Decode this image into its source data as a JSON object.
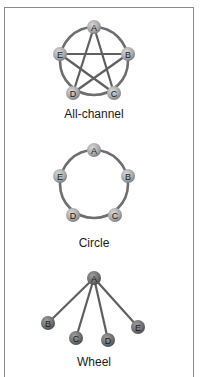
{
  "diagrams": [
    {
      "title": "All-channel",
      "type": "all-channel",
      "nodes": [
        {
          "id": "A",
          "x": 94,
          "y": 27
        },
        {
          "id": "B",
          "x": 128,
          "y": 54
        },
        {
          "id": "C",
          "x": 114,
          "y": 93
        },
        {
          "id": "D",
          "x": 73,
          "y": 93
        },
        {
          "id": "E",
          "x": 60,
          "y": 54
        }
      ],
      "ring": {
        "cx": 94,
        "cy": 61,
        "r": 34
      },
      "edges": [
        [
          "A",
          "C"
        ],
        [
          "A",
          "D"
        ],
        [
          "B",
          "D"
        ],
        [
          "B",
          "E"
        ],
        [
          "C",
          "E"
        ]
      ],
      "label_y": 118
    },
    {
      "title": "Circle",
      "type": "circle",
      "nodes": [
        {
          "id": "A",
          "x": 94,
          "y": 150
        },
        {
          "id": "B",
          "x": 128,
          "y": 176
        },
        {
          "id": "C",
          "x": 115,
          "y": 215
        },
        {
          "id": "D",
          "x": 73,
          "y": 215
        },
        {
          "id": "E",
          "x": 60,
          "y": 176
        }
      ],
      "ring": {
        "cx": 94,
        "cy": 184,
        "r": 34
      },
      "edges": [],
      "label_y": 247
    },
    {
      "title": "Wheel",
      "type": "wheel",
      "nodes": [
        {
          "id": "A",
          "x": 94,
          "y": 278
        },
        {
          "id": "B",
          "x": 48,
          "y": 323
        },
        {
          "id": "C",
          "x": 76,
          "y": 338
        },
        {
          "id": "D",
          "x": 108,
          "y": 340
        },
        {
          "id": "E",
          "x": 138,
          "y": 327
        }
      ],
      "ring": null,
      "edges": [
        [
          "A",
          "B"
        ],
        [
          "A",
          "C"
        ],
        [
          "A",
          "D"
        ],
        [
          "A",
          "E"
        ]
      ],
      "label_y": 366
    }
  ],
  "colors": {
    "frame": "#8a8a8a",
    "ring": "#6e6e6e",
    "edge": "#5f5f5f",
    "node_light": "#c4c4c4",
    "node_dark": "#7a7a7a",
    "text": "#1a1a1a"
  }
}
